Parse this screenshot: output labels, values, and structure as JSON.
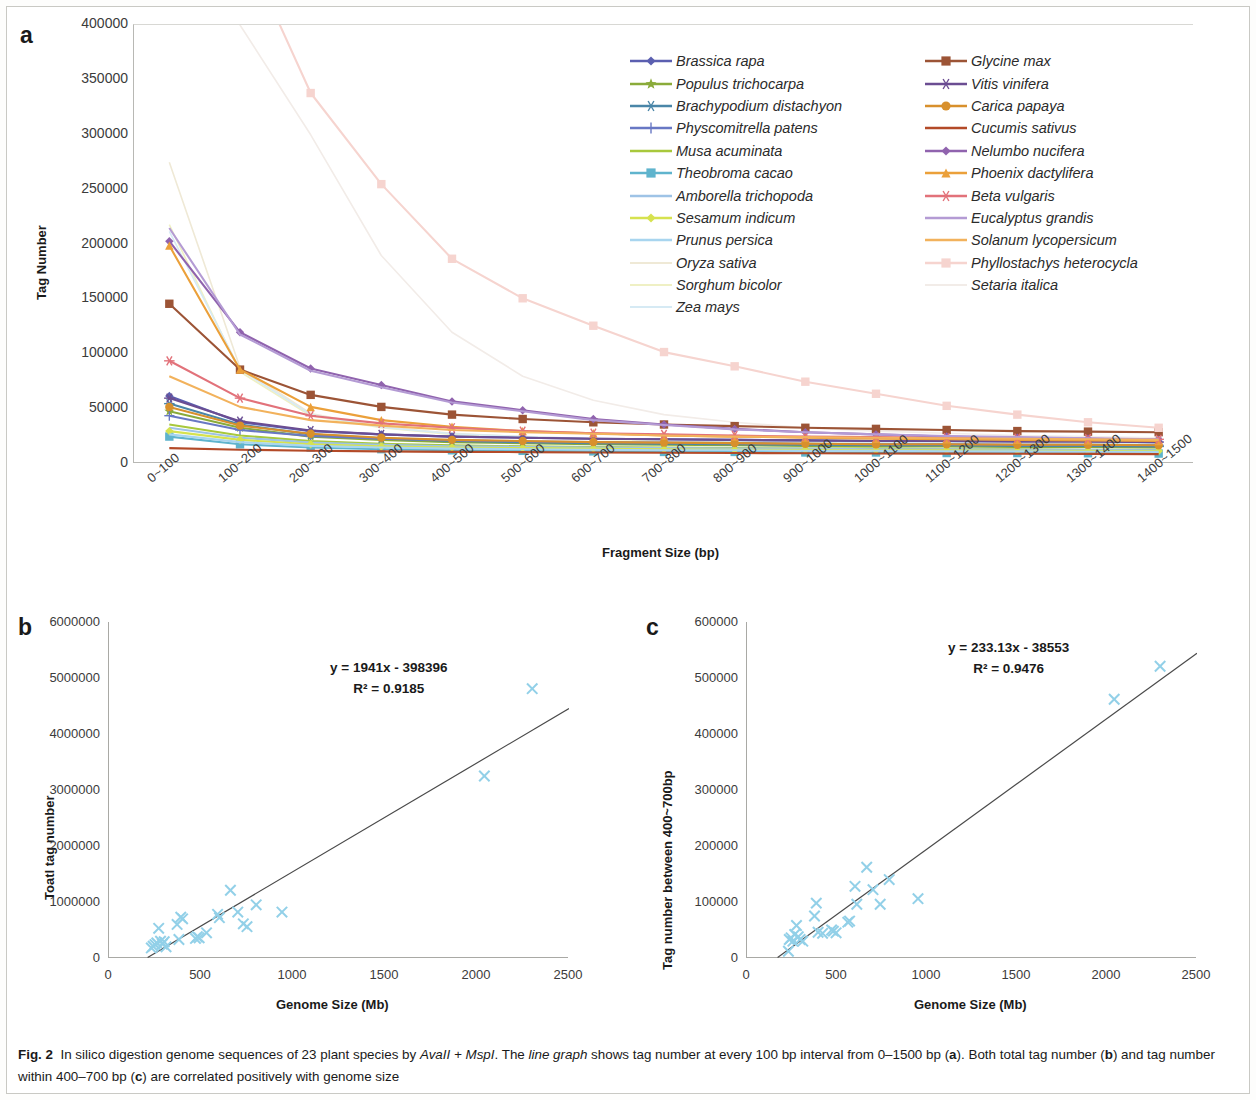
{
  "figure": {
    "panel_a_letter": "a",
    "panel_b_letter": "b",
    "panel_c_letter": "c",
    "caption_prefix": "Fig. 2",
    "caption_part1": "In silico digestion genome sequences of 23 plant species by ",
    "caption_italic1": "AvaII + MspI",
    "caption_part2": ". The ",
    "caption_italic2": "line graph",
    "caption_part3": " shows tag number at every 100 bp interval from 0–1500 bp (",
    "caption_bold_a": "a",
    "caption_part4": "). Both total tag number (",
    "caption_bold_b": "b",
    "caption_part5": ") and tag number within 400–700 bp (",
    "caption_bold_c": "c",
    "caption_part6": ") are correlated positively with genome size"
  },
  "chart_data": [
    {
      "type": "line",
      "panel": "a",
      "title": "",
      "xlabel": "Fragment Size (bp)",
      "ylabel": "Tag Number",
      "ylim": [
        0,
        400000
      ],
      "yticks": [
        0,
        50000,
        100000,
        150000,
        200000,
        250000,
        300000,
        350000,
        400000
      ],
      "ytick_labels": [
        "0",
        "50000",
        "100000",
        "150000",
        "200000",
        "250000",
        "300000",
        "350000",
        "400000"
      ],
      "grid": false,
      "legend_position": "inside-upper-right",
      "categories": [
        "0~100",
        "100~200",
        "200~300",
        "300~400",
        "400~500",
        "500~600",
        "600~700",
        "700~800",
        "800~900",
        "900~1000",
        "1000~1100",
        "1100~1200",
        "1200~1300",
        "1300~1400",
        "1400~1500"
      ],
      "series": [
        {
          "name": "Brassica rapa",
          "color": "#5b5fb0",
          "marker": "diamond",
          "values": [
            62000,
            38000,
            30000,
            27000,
            25000,
            24000,
            23000,
            22500,
            22000,
            21500,
            21000,
            21000,
            20500,
            20500,
            20000
          ]
        },
        {
          "name": "Populus trichocarpa",
          "color": "#8aab3a",
          "marker": "star",
          "values": [
            48000,
            33000,
            25000,
            22000,
            20000,
            19000,
            18000,
            17500,
            17000,
            16500,
            16000,
            16000,
            15500,
            15500,
            15000
          ]
        },
        {
          "name": "Brachypodium distachyon",
          "color": "#4a86a8",
          "marker": "asterisk",
          "values": [
            55000,
            36000,
            27000,
            23500,
            21000,
            20000,
            19000,
            18500,
            18000,
            17500,
            17000,
            17000,
            16500,
            16500,
            16000
          ]
        },
        {
          "name": "Physcomitrella patens",
          "color": "#6878c4",
          "marker": "plus",
          "values": [
            44000,
            31000,
            25500,
            23000,
            21500,
            20500,
            20000,
            19500,
            19000,
            18500,
            18000,
            18000,
            17500,
            17500,
            17000
          ]
        },
        {
          "name": "Musa acuminata",
          "color": "#a8c83c",
          "marker": "line",
          "values": [
            36000,
            26000,
            21000,
            18500,
            17000,
            16000,
            15500,
            15000,
            14500,
            14000,
            14000,
            13500,
            13500,
            13000,
            13000
          ]
        },
        {
          "name": "Theobroma cacao",
          "color": "#5fb4cd",
          "marker": "square",
          "values": [
            25000,
            18000,
            15000,
            13500,
            12500,
            12000,
            11500,
            11000,
            11000,
            10500,
            10500,
            10000,
            10000,
            9800,
            9500
          ]
        },
        {
          "name": "Amborella trichopoda",
          "color": "#9ec3e6",
          "marker": "line",
          "values": [
            33000,
            24000,
            19500,
            17500,
            16000,
            15500,
            15000,
            14500,
            14000,
            14000,
            13500,
            13500,
            13000,
            13000,
            12500
          ]
        },
        {
          "name": "Sesamum indicum",
          "color": "#d6e24f",
          "marker": "diamond",
          "values": [
            30000,
            22000,
            18000,
            16000,
            15000,
            14500,
            14000,
            13500,
            13000,
            13000,
            12500,
            12500,
            12000,
            12000,
            11800
          ]
        },
        {
          "name": "Prunus persica",
          "color": "#a8d5ef",
          "marker": "line",
          "values": [
            27000,
            20000,
            16500,
            15000,
            14000,
            13500,
            13000,
            12500,
            12500,
            12000,
            12000,
            11500,
            11500,
            11200,
            11000
          ]
        },
        {
          "name": "Oryza sativa",
          "color": "#efe9d6",
          "marker": "none",
          "values": [
            275000,
            88000,
            46000,
            34000,
            28000,
            25000,
            23000,
            22000,
            21000,
            20500,
            20000,
            20000,
            19500,
            19500,
            19000
          ]
        },
        {
          "name": "Sorghum bicolor",
          "color": "#eff0c4",
          "marker": "none",
          "values": [
            218000,
            84000,
            44000,
            33000,
            27000,
            24500,
            22500,
            21500,
            21000,
            20000,
            19500,
            19500,
            19000,
            19000,
            18500
          ]
        },
        {
          "name": "Zea mays",
          "color": "#d6eaf4",
          "marker": "none",
          "values": [
            212000,
            86000,
            45000,
            33500,
            27500,
            25000,
            23000,
            22000,
            21000,
            20500,
            20000,
            20000,
            19500,
            19500,
            19000
          ]
        },
        {
          "name": "Glycine max",
          "color": "#9c5436",
          "marker": "square",
          "values": [
            146000,
            86000,
            63000,
            52000,
            45000,
            41000,
            38000,
            36000,
            34500,
            33000,
            32000,
            31000,
            30000,
            29500,
            29000
          ]
        },
        {
          "name": "Vitis vinifera",
          "color": "#6b4d92",
          "marker": "asterisk",
          "values": [
            60000,
            39000,
            30500,
            27000,
            25000,
            24000,
            23000,
            22500,
            22000,
            21500,
            21000,
            21000,
            20500,
            20500,
            20000
          ]
        },
        {
          "name": "Carica papaya",
          "color": "#d8902c",
          "marker": "circle",
          "values": [
            52000,
            35000,
            27500,
            24000,
            22000,
            21000,
            20000,
            19500,
            19000,
            18500,
            18000,
            18000,
            17500,
            17500,
            17000
          ]
        },
        {
          "name": "Cucumis sativus",
          "color": "#b34a28",
          "marker": "line",
          "values": [
            14500,
            13000,
            12000,
            11500,
            11000,
            10800,
            10500,
            10200,
            10000,
            9800,
            9600,
            9500,
            9300,
            9200,
            9000
          ]
        },
        {
          "name": "Nelumbo nucifera",
          "color": "#9063ae",
          "marker": "diamond",
          "values": [
            203000,
            120000,
            87000,
            72000,
            57000,
            49000,
            41000,
            36000,
            32000,
            29000,
            27000,
            25000,
            24000,
            23000,
            22000
          ]
        },
        {
          "name": "Phoenix dactylifera",
          "color": "#eba03a",
          "marker": "triangle",
          "values": [
            199000,
            86000,
            52000,
            40000,
            34000,
            30000,
            28000,
            26000,
            25000,
            24000,
            23000,
            22500,
            22000,
            21500,
            21000
          ]
        },
        {
          "name": "Beta vulgaris",
          "color": "#e2727a",
          "marker": "asterisk",
          "values": [
            94000,
            60000,
            44000,
            37000,
            33000,
            30000,
            28000,
            27000,
            26000,
            25000,
            24500,
            24000,
            23500,
            23000,
            22500
          ]
        },
        {
          "name": "Eucalyptus grandis",
          "color": "#b49bd4",
          "marker": "line",
          "values": [
            215000,
            118000,
            85000,
            70000,
            56000,
            48000,
            40000,
            35500,
            31500,
            29000,
            27000,
            25500,
            24500,
            23500,
            22500
          ]
        },
        {
          "name": "Solanum lycopersicum",
          "color": "#f2b25c",
          "marker": "line",
          "values": [
            80000,
            52000,
            40000,
            35000,
            31000,
            29000,
            27500,
            26000,
            25000,
            24500,
            24000,
            23500,
            23000,
            22500,
            22000
          ]
        },
        {
          "name": "Phyllostachys heterocycla",
          "color": "#f6d4cf",
          "marker": "square",
          "values": [
            760000,
            480000,
            338000,
            255000,
            187000,
            151000,
            126000,
            102000,
            89000,
            75000,
            64000,
            53000,
            45000,
            38000,
            33000
          ]
        },
        {
          "name": "Setaria italica",
          "color": "#f2ece8",
          "marker": "none",
          "values": [
            560000,
            400000,
            300000,
            190000,
            120000,
            80000,
            58000,
            45000,
            38000,
            33000,
            30000,
            28000,
            26000,
            25000,
            24000
          ]
        }
      ]
    },
    {
      "type": "scatter",
      "panel": "b",
      "title": "",
      "xlabel": "Genome Size (Mb)",
      "ylabel": "Toatl tag number",
      "xlim": [
        0,
        2500
      ],
      "ylim": [
        0,
        6000000
      ],
      "xticks": [
        0,
        500,
        1000,
        1500,
        2000,
        2500
      ],
      "xtick_labels": [
        "0",
        "500",
        "1000",
        "1500",
        "2000",
        "2500"
      ],
      "yticks": [
        0,
        1000000,
        2000000,
        3000000,
        4000000,
        5000000,
        6000000
      ],
      "ytick_labels": [
        "0",
        "1000000",
        "2000000",
        "3000000",
        "4000000",
        "5000000",
        "6000000"
      ],
      "marker": "x",
      "marker_color": "#92d0e8",
      "trendline": {
        "slope": 1941,
        "intercept": -398396,
        "color": "#4a4a4a",
        "equation": "y = 1941x - 398396",
        "r2_label": "R² = 0.9185",
        "r2": 0.9185
      },
      "points": [
        {
          "x": 230,
          "y": 180000
        },
        {
          "x": 240,
          "y": 210000
        },
        {
          "x": 250,
          "y": 240000
        },
        {
          "x": 260,
          "y": 270000
        },
        {
          "x": 270,
          "y": 530000
        },
        {
          "x": 280,
          "y": 300000
        },
        {
          "x": 290,
          "y": 250000
        },
        {
          "x": 300,
          "y": 290000
        },
        {
          "x": 310,
          "y": 200000
        },
        {
          "x": 370,
          "y": 600000
        },
        {
          "x": 380,
          "y": 330000
        },
        {
          "x": 390,
          "y": 730000
        },
        {
          "x": 400,
          "y": 700000
        },
        {
          "x": 470,
          "y": 350000
        },
        {
          "x": 480,
          "y": 380000
        },
        {
          "x": 490,
          "y": 360000
        },
        {
          "x": 530,
          "y": 450000
        },
        {
          "x": 590,
          "y": 780000
        },
        {
          "x": 600,
          "y": 720000
        },
        {
          "x": 660,
          "y": 1210000
        },
        {
          "x": 700,
          "y": 820000
        },
        {
          "x": 730,
          "y": 610000
        },
        {
          "x": 750,
          "y": 560000
        },
        {
          "x": 800,
          "y": 950000
        },
        {
          "x": 940,
          "y": 820000
        },
        {
          "x": 2040,
          "y": 3250000
        },
        {
          "x": 2300,
          "y": 4810000
        }
      ]
    },
    {
      "type": "scatter",
      "panel": "c",
      "title": "",
      "xlabel": "Genome Size (Mb)",
      "ylabel": "Tag number between 400~700bp",
      "xlim": [
        0,
        2500
      ],
      "ylim": [
        0,
        600000
      ],
      "xticks": [
        0,
        500,
        1000,
        1500,
        2000,
        2500
      ],
      "xtick_labels": [
        "0",
        "500",
        "1000",
        "1500",
        "2000",
        "2500"
      ],
      "yticks": [
        0,
        100000,
        200000,
        300000,
        400000,
        500000,
        600000
      ],
      "ytick_labels": [
        "0",
        "100000",
        "200000",
        "300000",
        "400000",
        "500000",
        "600000"
      ],
      "marker": "x",
      "marker_color": "#92d0e8",
      "trendline": {
        "slope": 233.13,
        "intercept": -38553,
        "color": "#4a4a4a",
        "equation": "y = 233.13x - 38553",
        "r2_label": "R² = 0.9476",
        "r2": 0.9476
      },
      "points": [
        {
          "x": 230,
          "y": 12000
        },
        {
          "x": 235,
          "y": 33000
        },
        {
          "x": 245,
          "y": 36000
        },
        {
          "x": 255,
          "y": 30000
        },
        {
          "x": 265,
          "y": 42000
        },
        {
          "x": 275,
          "y": 58000
        },
        {
          "x": 285,
          "y": 38000
        },
        {
          "x": 295,
          "y": 33000
        },
        {
          "x": 310,
          "y": 30000
        },
        {
          "x": 375,
          "y": 75000
        },
        {
          "x": 385,
          "y": 98000
        },
        {
          "x": 395,
          "y": 46000
        },
        {
          "x": 420,
          "y": 44000
        },
        {
          "x": 470,
          "y": 50000
        },
        {
          "x": 480,
          "y": 48000
        },
        {
          "x": 495,
          "y": 45000
        },
        {
          "x": 560,
          "y": 64000
        },
        {
          "x": 570,
          "y": 66000
        },
        {
          "x": 600,
          "y": 128000
        },
        {
          "x": 610,
          "y": 96000
        },
        {
          "x": 665,
          "y": 162000
        },
        {
          "x": 700,
          "y": 122000
        },
        {
          "x": 740,
          "y": 96000
        },
        {
          "x": 790,
          "y": 140000
        },
        {
          "x": 950,
          "y": 106000
        },
        {
          "x": 2040,
          "y": 462000
        },
        {
          "x": 2295,
          "y": 521000
        }
      ]
    }
  ]
}
